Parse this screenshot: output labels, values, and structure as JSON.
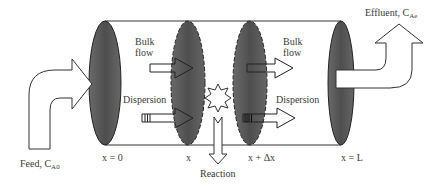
{
  "diagram": {
    "colors": {
      "ellipse_fill": "#555555",
      "line": "#333333",
      "background": "#ffffff"
    },
    "labels": {
      "feed": "Feed, C",
      "feed_sub": "A0",
      "effluent": "Effluent, C",
      "effluent_sub": "Ae",
      "bulk_flow_left_1": "Bulk",
      "bulk_flow_left_2": "flow",
      "bulk_flow_right_1": "Bulk",
      "bulk_flow_right_2": "flow",
      "dispersion_left": "Dispersion",
      "dispersion_right": "Dispersion",
      "reaction": "Reaction",
      "pos_x0": "x = 0",
      "pos_x": "x",
      "pos_xdx": "x + Δx",
      "pos_xL": "x = L"
    },
    "nodes": [
      {
        "id": "inlet-face",
        "label": "x = 0"
      },
      {
        "id": "element-in-face",
        "label": "x"
      },
      {
        "id": "element-out-face",
        "label": "x + Δx"
      },
      {
        "id": "outlet-face",
        "label": "x = L"
      },
      {
        "id": "reaction-site",
        "label": "Reaction"
      }
    ],
    "edges": [
      {
        "from": "feed",
        "to": "inlet-face",
        "label": "Feed, C_A0"
      },
      {
        "from": "bulk-left",
        "to": "element-in-face",
        "label": "Bulk flow"
      },
      {
        "from": "dispersion-left",
        "to": "element-in-face",
        "label": "Dispersion"
      },
      {
        "from": "element-out-face",
        "to": "bulk-right",
        "label": "Bulk flow"
      },
      {
        "from": "element-out-face",
        "to": "dispersion-right",
        "label": "Dispersion"
      },
      {
        "from": "reaction-site",
        "to": "sink",
        "label": "Reaction"
      },
      {
        "from": "outlet-face",
        "to": "effluent",
        "label": "Effluent, C_Ae"
      }
    ]
  }
}
